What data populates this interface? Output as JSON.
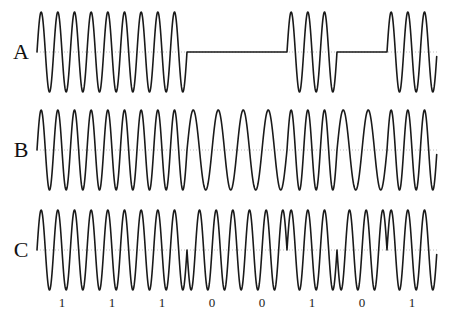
{
  "figure": {
    "title": "",
    "background_color": "#ffffff",
    "wave_color": "#1a1a1a",
    "axis_color": "#b0b0b0",
    "wave_stroke_width": 1.6,
    "axis_stroke_width": 0.8,
    "axis_dash": "1,2"
  },
  "plot_geometry": {
    "x_start": 37,
    "x_end": 437,
    "bit_width": 50,
    "bit_count": 8
  },
  "bitstream": {
    "label_row": "C",
    "bits": [
      "1",
      "1",
      "1",
      "0",
      "0",
      "1",
      "0",
      "1"
    ],
    "tick_positions": [
      62,
      112,
      162,
      212,
      262,
      312,
      362,
      412
    ]
  },
  "rows": [
    {
      "key": "A",
      "label": "A",
      "modulation": "ask",
      "baseline_y": 52,
      "amplitude": 40,
      "label_y": 41,
      "cycles_per_bit": 3,
      "carrier_amplitude_for_one": 40,
      "carrier_amplitude_for_zero": 0
    },
    {
      "key": "B",
      "label": "B",
      "modulation": "fsk",
      "baseline_y": 150,
      "amplitude": 40,
      "label_y": 139,
      "cycles_per_bit_for_one": 3,
      "cycles_per_bit_for_zero": 2
    },
    {
      "key": "C",
      "label": "C",
      "modulation": "psk",
      "baseline_y": 250,
      "amplitude": 40,
      "label_y": 239,
      "cycles_per_bit": 3,
      "phase_for_one_deg": 0,
      "phase_for_zero_deg": 180
    }
  ],
  "chart_data": {
    "type": "line",
    "title": "",
    "xlabel": "",
    "ylabel": "",
    "categories": [
      "1",
      "1",
      "1",
      "0",
      "0",
      "1",
      "0",
      "1"
    ],
    "series": [
      {
        "name": "A",
        "description": "Amplitude shift keying (ASK) — carrier present for bit 1, flat line for bit 0",
        "values": [
          1,
          1,
          1,
          0,
          0,
          1,
          0,
          1
        ]
      },
      {
        "name": "B",
        "description": "Frequency shift keying (FSK) — high frequency for bit 1, low frequency for bit 0",
        "values": [
          3,
          3,
          3,
          2,
          2,
          3,
          2,
          3
        ]
      },
      {
        "name": "C",
        "description": "Phase shift keying (PSK) — 0 degrees for bit 1, 180 degrees for bit 0",
        "values": [
          0,
          0,
          0,
          180,
          180,
          0,
          180,
          0
        ]
      }
    ],
    "grid": false,
    "legend": "none"
  }
}
